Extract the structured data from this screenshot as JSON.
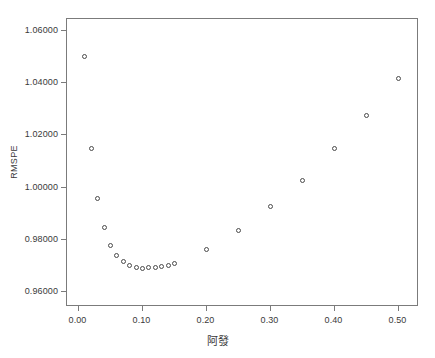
{
  "chart_data": {
    "type": "scatter",
    "title": "",
    "xlabel": "阿發",
    "ylabel": "RMSPE",
    "xlim": [
      -0.018,
      0.532
    ],
    "ylim": [
      0.9543,
      1.0645
    ],
    "grid": false,
    "legend": "none",
    "marker": "open-circle",
    "marker_color": "#4a4a4a",
    "xticks": [
      "0.00",
      "0.10",
      "0.20",
      "0.30",
      "0.40",
      "0.50"
    ],
    "xtick_values": [
      0.0,
      0.1,
      0.2,
      0.3,
      0.4,
      0.5
    ],
    "yticks": [
      "0.96000",
      "0.98000",
      "1.00000",
      "1.02000",
      "1.04000",
      "1.06000"
    ],
    "ytick_values": [
      0.96,
      0.98,
      1.0,
      1.02,
      1.04,
      1.06
    ],
    "x": [
      0.01,
      0.02,
      0.03,
      0.04,
      0.05,
      0.06,
      0.07,
      0.08,
      0.09,
      0.1,
      0.11,
      0.12,
      0.13,
      0.14,
      0.15,
      0.2,
      0.25,
      0.3,
      0.35,
      0.4,
      0.45,
      0.5
    ],
    "values": [
      1.0501,
      1.0148,
      0.996,
      0.9848,
      0.9779,
      0.974,
      0.9717,
      0.97,
      0.96945,
      0.9691,
      0.9693,
      0.9695,
      0.9699,
      0.9703,
      0.9709,
      0.9762,
      0.9836,
      0.9926,
      1.0026,
      1.0148,
      1.0274,
      1.0418
    ],
    "points": [
      {
        "x": 0.01,
        "y": 1.0501
      },
      {
        "x": 0.02,
        "y": 1.0148
      },
      {
        "x": 0.03,
        "y": 0.996
      },
      {
        "x": 0.04,
        "y": 0.9848
      },
      {
        "x": 0.05,
        "y": 0.9779
      },
      {
        "x": 0.06,
        "y": 0.974
      },
      {
        "x": 0.07,
        "y": 0.9717
      },
      {
        "x": 0.08,
        "y": 0.97
      },
      {
        "x": 0.09,
        "y": 0.96945
      },
      {
        "x": 0.1,
        "y": 0.9691
      },
      {
        "x": 0.11,
        "y": 0.9693
      },
      {
        "x": 0.12,
        "y": 0.9695
      },
      {
        "x": 0.13,
        "y": 0.9699
      },
      {
        "x": 0.14,
        "y": 0.9703
      },
      {
        "x": 0.15,
        "y": 0.9709
      },
      {
        "x": 0.2,
        "y": 0.9762
      },
      {
        "x": 0.25,
        "y": 0.9836
      },
      {
        "x": 0.3,
        "y": 0.9926
      },
      {
        "x": 0.35,
        "y": 1.0026
      },
      {
        "x": 0.4,
        "y": 1.0148
      },
      {
        "x": 0.45,
        "y": 1.0274
      },
      {
        "x": 0.5,
        "y": 1.0418
      }
    ]
  }
}
